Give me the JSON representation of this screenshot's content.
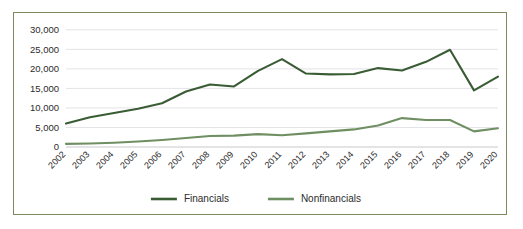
{
  "chart_data": {
    "type": "line",
    "title": "",
    "xlabel": "",
    "ylabel": "",
    "ylim": [
      0,
      32000
    ],
    "ytick_values": [
      0,
      5000,
      10000,
      15000,
      20000,
      25000,
      30000
    ],
    "ytick_labels": [
      "0",
      "5,000",
      "10,000",
      "15,000",
      "20,000",
      "25,000",
      "30,000"
    ],
    "grid": true,
    "legend_position": "bottom",
    "categories": [
      "2002",
      "2003",
      "2004",
      "2005",
      "2006",
      "2007",
      "2008",
      "2009",
      "2010",
      "2011",
      "2012",
      "2013",
      "2014",
      "2015",
      "2016",
      "2017",
      "2018",
      "2019",
      "2020"
    ],
    "series": [
      {
        "name": "Financials",
        "color": "#3d5e३8",
        "values": [
          6000,
          7600,
          8700,
          9800,
          11200,
          14200,
          16000,
          15500,
          19500,
          22500,
          18800,
          18600,
          18700,
          20200,
          19600,
          21800,
          24900,
          14500,
          18000
        ]
      },
      {
        "name": "Nonfinancials",
        "color": "#6f8f63",
        "values": [
          800,
          900,
          1100,
          1400,
          1800,
          2300,
          2800,
          2900,
          3300,
          3000,
          3500,
          4000,
          4500,
          5500,
          7400,
          6900,
          6900,
          4000,
          4800
        ]
      }
    ]
  },
  "legend": {
    "items": [
      {
        "label": "Financials",
        "color": "#3a5c35"
      },
      {
        "label": "Nonfinancials",
        "color": "#6f8f63"
      }
    ]
  },
  "colors": {
    "financials": "#3a5c35",
    "nonfinancials": "#6f8f63",
    "frame_border": "#7d8a5e",
    "gridline": "#e3e3e8",
    "text": "#2b2b2b"
  }
}
